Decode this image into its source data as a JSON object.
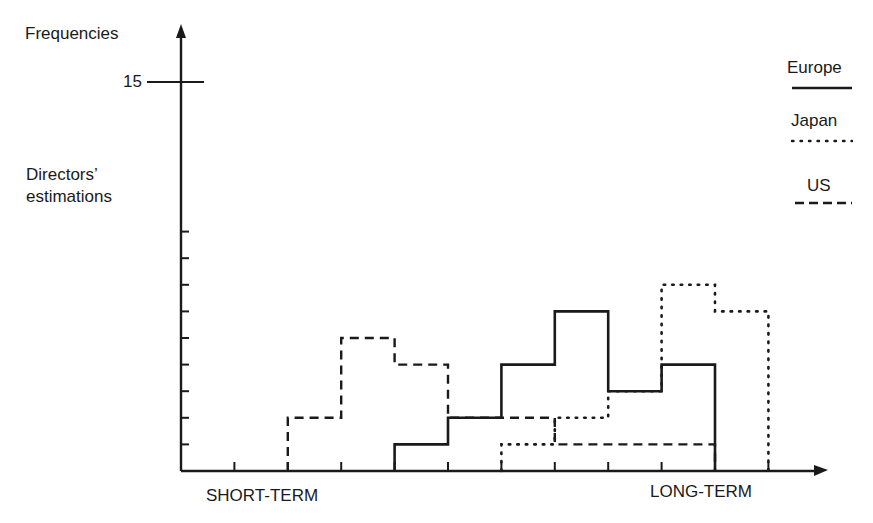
{
  "chart_data": {
    "type": "step-histogram",
    "title": "",
    "ylabel": "Frequencies",
    "ylabel_secondary": "Directors' estimations",
    "y_tick_labeled": 15,
    "y_tick_label": "15",
    "ylim": [
      0,
      16
    ],
    "xlabel_left": "SHORT-TERM",
    "xlabel_right": "LONG-TERM",
    "x_bins": 11,
    "legend_position": "top-right",
    "series": [
      {
        "name": "Europe",
        "style": "solid",
        "steps": [
          {
            "from": 4,
            "to": 5,
            "value": 1
          },
          {
            "from": 5,
            "to": 6,
            "value": 2
          },
          {
            "from": 6,
            "to": 7,
            "value": 4
          },
          {
            "from": 7,
            "to": 8,
            "value": 6
          },
          {
            "from": 8,
            "to": 9,
            "value": 3
          },
          {
            "from": 9,
            "to": 10,
            "value": 4
          }
        ]
      },
      {
        "name": "Japan",
        "style": "dotted",
        "steps": [
          {
            "from": 6,
            "to": 7,
            "value": 1
          },
          {
            "from": 7,
            "to": 8,
            "value": 2
          },
          {
            "from": 8,
            "to": 9,
            "value": 3
          },
          {
            "from": 9,
            "to": 10,
            "value": 7
          },
          {
            "from": 10,
            "to": 11,
            "value": 6
          }
        ]
      },
      {
        "name": "US",
        "style": "dashed",
        "steps": [
          {
            "from": 2,
            "to": 3,
            "value": 2
          },
          {
            "from": 3,
            "to": 4,
            "value": 5
          },
          {
            "from": 4,
            "to": 5,
            "value": 4
          },
          {
            "from": 5,
            "to": 6,
            "value": 2
          },
          {
            "from": 6,
            "to": 7,
            "value": 2
          },
          {
            "from": 7,
            "to": 10,
            "value": 1
          }
        ]
      }
    ]
  },
  "labels": {
    "y_axis_title": "Frequencies",
    "y_tick_15": "15",
    "directors_line1": "Directors’",
    "directors_line2": "estimations",
    "x_left": "SHORT-TERM",
    "x_right": "LONG-TERM"
  },
  "legend": [
    {
      "name": "Europe",
      "style": "solid"
    },
    {
      "name": "Japan",
      "style": "dotted"
    },
    {
      "name": "US",
      "style": "dashed"
    }
  ],
  "colors": {
    "ink": "#1a1a1a",
    "background": "#ffffff"
  }
}
